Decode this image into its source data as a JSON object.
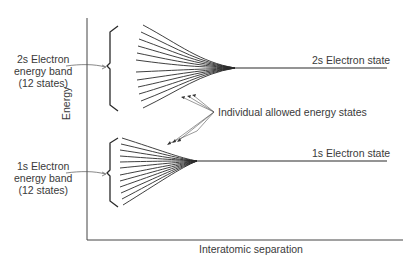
{
  "figure": {
    "axes": {
      "ylabel": "Energy",
      "xlabel": "Interatomic separation"
    },
    "bands": [
      {
        "id": "2s",
        "label_lines": [
          "2s Electron",
          "energy band",
          "(12 states)"
        ],
        "state_label": "2s Electron state",
        "num_states": 12
      },
      {
        "id": "1s",
        "label_lines": [
          "1s Electron",
          "energy band",
          "(12 states)"
        ],
        "state_label": "1s Electron state",
        "num_states": 12
      }
    ],
    "annotation": "Individual allowed energy states",
    "colors": {
      "line": "#2a2a2a",
      "text": "#3a3a3a",
      "background": "#ffffff"
    }
  }
}
